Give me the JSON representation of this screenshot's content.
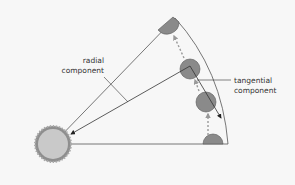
{
  "diagram": {
    "labels": {
      "radial_line1": "radial",
      "radial_line2": "component",
      "tangential_line1": "tangential",
      "tangential_line2": "component"
    },
    "colors": {
      "background": "#f7f7f7",
      "line": "#555555",
      "ball_fill": "#8a8a8a",
      "hub_fill": "#c9c9c9",
      "hub_ring": "#8e8e8e",
      "arrow_dash": "#9a9a9a"
    }
  }
}
